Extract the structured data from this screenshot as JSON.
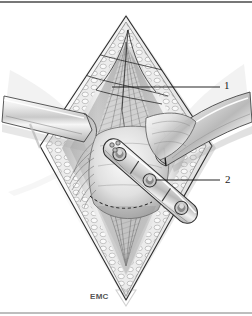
{
  "figure": {
    "type": "medical-line-illustration",
    "palette": {
      "background": "#ffffff",
      "ink": "#1a1a1a",
      "line": "#3a3a3a",
      "wash_light": "#f2f2f2",
      "wash_mid": "#d8d8d8",
      "wash_dark": "#9a9a9a",
      "shadow": "#6e6e6e",
      "border": "#4a4a4a"
    },
    "frame": {
      "top_rule": true,
      "bottom_rule": true
    },
    "callouts": [
      {
        "id": "1",
        "label": "1",
        "leader_from_x": 112,
        "leader_to_x": 220,
        "leader_y": 87
      },
      {
        "id": "2",
        "label": "2",
        "leader_from_x": 156,
        "leader_to_x": 220,
        "leader_y": 180
      }
    ],
    "signature": "EMC",
    "elements": {
      "incision": "diamond-shaped wound opening",
      "left_retractor": "flat blade retractor entering from left",
      "right_retractor": "curved blade retractor entering from right",
      "plate": "bone fixation plate with screw holes",
      "sutures": "converging suture threads at apex",
      "osteotomy_marker": "dashed curved guide line"
    }
  }
}
